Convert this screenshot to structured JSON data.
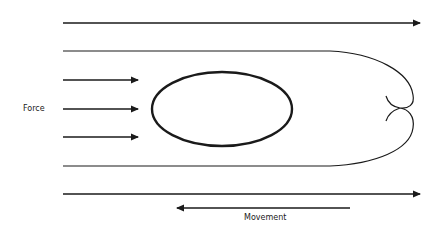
{
  "diagram": {
    "labels": {
      "force": "Force",
      "movement": "Movement"
    },
    "colors": {
      "stroke": "#1a1a1a",
      "background": "#ffffff"
    },
    "elements": {
      "force_arrows": 3,
      "flow_lines": 4,
      "obstacle": "ellipse",
      "movement_arrow_direction": "left"
    }
  }
}
